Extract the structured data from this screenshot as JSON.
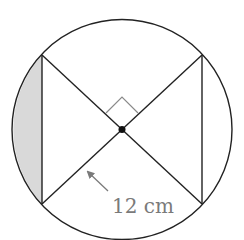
{
  "diagram": {
    "radius_label": "12 cm",
    "shaded_region": "circular segment left of left chord",
    "right_angle_marker": true,
    "center_dot": true,
    "colors": {
      "stroke": "#222222",
      "shade": "#d9d9d9",
      "label": "#7a7a7a",
      "right_angle": "#8a8a8a",
      "arrow": "#7a7a7a"
    }
  }
}
